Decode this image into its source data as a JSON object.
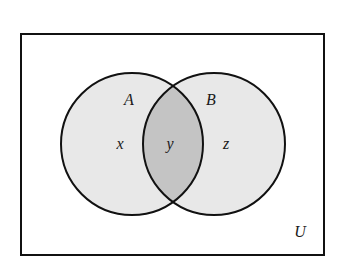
{
  "diagram": {
    "type": "venn",
    "universe": {
      "label": "U",
      "x": 21,
      "y": 34,
      "width": 303,
      "height": 221
    },
    "sets": [
      {
        "label": "A",
        "cx": 132,
        "cy": 144,
        "r": 71
      },
      {
        "label": "B",
        "cx": 214,
        "cy": 144,
        "r": 71
      }
    ],
    "regions": [
      {
        "label": "x",
        "description": "A only"
      },
      {
        "label": "y",
        "description": "A and B"
      },
      {
        "label": "z",
        "description": "B only"
      }
    ],
    "colors": {
      "background": "#ffffff",
      "set_fill": "#e8e8e8",
      "intersection_fill": "#c4c4c4",
      "stroke": "#111111"
    }
  }
}
